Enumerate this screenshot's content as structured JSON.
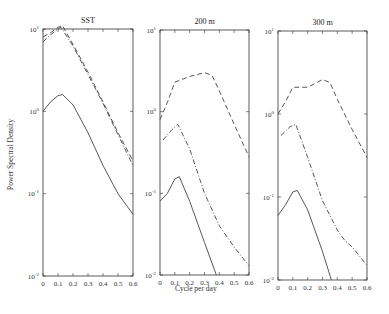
{
  "chart_data": [
    {
      "type": "line",
      "title": "SST",
      "xlabel": "",
      "ylabel": "Power Spectral Density",
      "yscale": "log",
      "xlim": [
        0,
        0.6
      ],
      "ylim": [
        0.01,
        10
      ],
      "xticks": [
        "0",
        "0.1",
        "0.2",
        "0.3",
        "0.4",
        "0.5",
        "0.6"
      ],
      "yticks": [
        "10^-2",
        "10^-1",
        "10^0",
        "10^1"
      ],
      "series": [
        {
          "name": "dashed",
          "style": "dashed",
          "x": [
            0,
            0.05,
            0.1,
            0.13,
            0.2,
            0.3,
            0.4,
            0.5,
            0.6
          ],
          "values": [
            8,
            9,
            10.5,
            11,
            6.5,
            3.0,
            1.3,
            0.55,
            0.25
          ]
        },
        {
          "name": "dash-dot",
          "style": "dashdot",
          "x": [
            0,
            0.05,
            0.1,
            0.12,
            0.2,
            0.3,
            0.4,
            0.5,
            0.6
          ],
          "values": [
            7,
            8.5,
            10,
            10.5,
            6.2,
            2.8,
            1.25,
            0.52,
            0.22
          ]
        },
        {
          "name": "solid",
          "style": "solid",
          "x": [
            0,
            0.05,
            0.1,
            0.13,
            0.2,
            0.3,
            0.4,
            0.5,
            0.6
          ],
          "values": [
            1.0,
            1.3,
            1.55,
            1.6,
            1.2,
            0.55,
            0.22,
            0.1,
            0.056
          ]
        }
      ]
    },
    {
      "type": "line",
      "title": "200 m",
      "xlabel": "Cycle per day",
      "yscale": "log",
      "xlim": [
        0,
        0.6
      ],
      "ylim": [
        0.01,
        10
      ],
      "xticks": [
        "0",
        "0.1",
        "0.2",
        "0.3",
        "0.4",
        "0.5",
        "0.6"
      ],
      "yticks": [
        "10^-2",
        "10^-1",
        "10^0",
        "10^1"
      ],
      "series": [
        {
          "name": "dashed",
          "style": "dashed",
          "x": [
            0,
            0.05,
            0.1,
            0.2,
            0.3,
            0.35,
            0.4,
            0.5,
            0.6
          ],
          "values": [
            0.8,
            1.3,
            2.3,
            2.7,
            3.0,
            2.8,
            1.8,
            0.7,
            0.28
          ]
        },
        {
          "name": "dash-dot",
          "style": "dashdot",
          "x": [
            0.02,
            0.08,
            0.12,
            0.2,
            0.3,
            0.4,
            0.5,
            0.6
          ],
          "values": [
            0.45,
            0.6,
            0.7,
            0.35,
            0.1,
            0.04,
            0.022,
            0.013
          ]
        },
        {
          "name": "solid",
          "style": "solid",
          "x": [
            0,
            0.05,
            0.1,
            0.13,
            0.2,
            0.3,
            0.38
          ],
          "values": [
            0.08,
            0.1,
            0.15,
            0.16,
            0.08,
            0.025,
            0.01
          ]
        }
      ]
    },
    {
      "type": "line",
      "title": "300 m",
      "xlabel": "",
      "yscale": "log",
      "xlim": [
        0,
        0.6
      ],
      "ylim": [
        0.01,
        10
      ],
      "xticks": [
        "0",
        "0.1",
        "0.2",
        "0.3",
        "0.4",
        "0.5",
        "0.6"
      ],
      "yticks": [
        "10^-2",
        "10^-1",
        "10^0",
        "10^1"
      ],
      "series": [
        {
          "name": "dashed",
          "style": "dashed",
          "x": [
            0,
            0.05,
            0.1,
            0.2,
            0.3,
            0.35,
            0.4,
            0.5,
            0.6
          ],
          "values": [
            1.0,
            1.4,
            2.1,
            2.1,
            2.6,
            2.4,
            1.5,
            0.65,
            0.3
          ]
        },
        {
          "name": "dash-dot",
          "style": "dashdot",
          "x": [
            0.02,
            0.08,
            0.12,
            0.2,
            0.3,
            0.4,
            0.45,
            0.5,
            0.6
          ],
          "values": [
            0.55,
            0.7,
            0.75,
            0.3,
            0.09,
            0.04,
            0.03,
            0.025,
            0.015
          ]
        },
        {
          "name": "solid",
          "style": "solid",
          "x": [
            0,
            0.05,
            0.1,
            0.13,
            0.2,
            0.3,
            0.36
          ],
          "values": [
            0.06,
            0.08,
            0.115,
            0.12,
            0.07,
            0.022,
            0.01
          ]
        }
      ]
    }
  ],
  "labels": {
    "ylabel": "Power Spectral Density",
    "xlabel": "Cycle per day"
  }
}
